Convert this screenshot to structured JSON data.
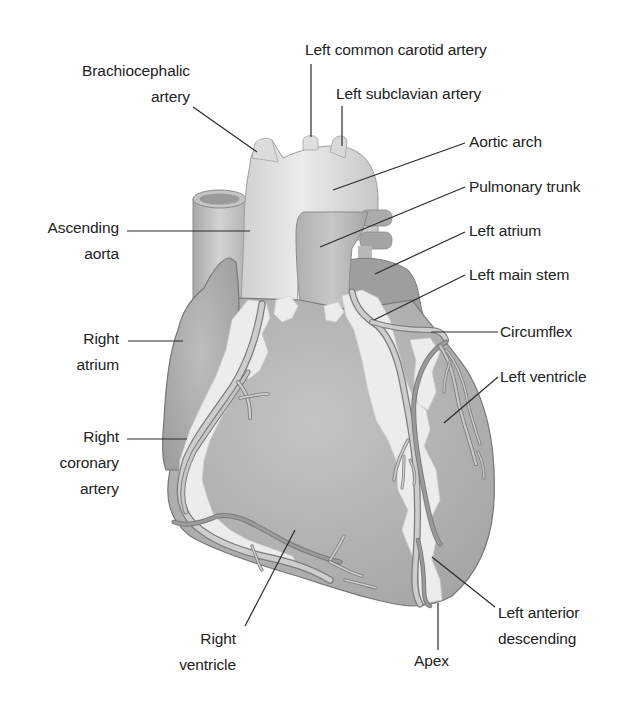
{
  "figure": {
    "colors": {
      "background": "#ffffff",
      "label_text": "#222222",
      "leader_line": "#2a2a2a",
      "great_vessels": "#d9d9d9",
      "aorta_highlight": "#e6e6e6",
      "pulmonary_trunk": "#b8b8b8",
      "atrium": "#a9a9a9",
      "ventricle": "#b3b3b3",
      "fat_highlight": "#e9e9e9",
      "coronary_vessel": "#c9c9c9",
      "vessel_outline": "#7a7a7a"
    }
  },
  "labels": {
    "brachiocephalic": {
      "line1": "Brachiocephalic",
      "line2": "artery"
    },
    "left_common_carotid": {
      "line1": "Left common carotid artery"
    },
    "left_subclavian": {
      "line1": "Left subclavian artery"
    },
    "aortic_arch": {
      "line1": "Aortic arch"
    },
    "pulmonary_trunk": {
      "line1": "Pulmonary trunk"
    },
    "left_atrium": {
      "line1": "Left atrium"
    },
    "left_main_stem": {
      "line1": "Left main stem"
    },
    "circumflex": {
      "line1": "Circumflex"
    },
    "left_ventricle": {
      "line1": "Left ventricle"
    },
    "ascending_aorta": {
      "line1": "Ascending",
      "line2": "aorta"
    },
    "right_atrium": {
      "line1": "Right",
      "line2": "atrium"
    },
    "right_coronary_artery": {
      "line1": "Right",
      "line2": "coronary",
      "line3": "artery"
    },
    "right_ventricle": {
      "line1": "Right",
      "line2": "ventricle"
    },
    "apex": {
      "line1": "Apex"
    },
    "left_anterior_descending": {
      "line1": "Left anterior",
      "line2": "descending"
    }
  }
}
